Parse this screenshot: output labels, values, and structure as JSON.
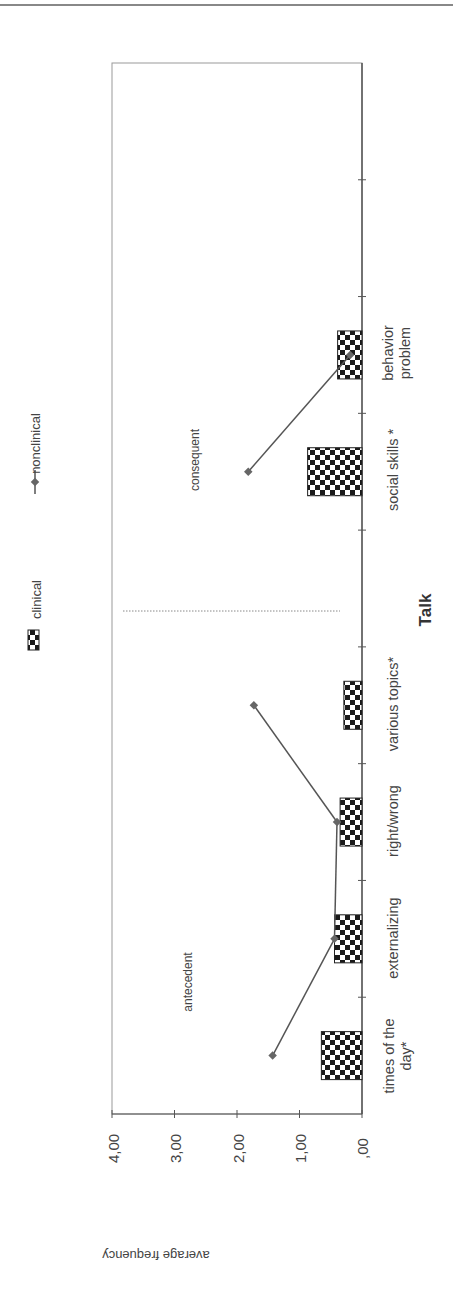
{
  "chart_data": {
    "type": "bar",
    "orientation": "rotated-90",
    "title": "",
    "xlabel": "Talk",
    "ylabel": "average frequency",
    "ylim": [
      0,
      4
    ],
    "yticks": [
      ",00",
      "1,00",
      "2,00",
      "3,00",
      "4,00"
    ],
    "grid": false,
    "legend_position": "top",
    "categories": [
      "times of the day*",
      "externalizing",
      "right/wrong",
      "various topics*",
      "",
      "social skills *",
      "behavior problem",
      "",
      ""
    ],
    "series": [
      {
        "name": "clinical",
        "kind": "bar",
        "pattern": "checkerboard",
        "values": [
          0.65,
          0.44,
          0.35,
          0.29,
          null,
          0.87,
          0.39,
          null,
          null
        ]
      },
      {
        "name": "nonclinical",
        "kind": "line",
        "marker": "diamond",
        "values": [
          1.43,
          0.44,
          0.4,
          1.73,
          null,
          1.82,
          0.19,
          null,
          null
        ]
      }
    ],
    "line_segments": [
      [
        0,
        1
      ],
      [
        1,
        2
      ],
      [
        2,
        3
      ],
      [
        5,
        6
      ]
    ],
    "annotations": [
      {
        "text": "antecedent",
        "group": "times of the day – various topics"
      },
      {
        "text": "consequent",
        "group": "social skills – behavior problem"
      }
    ],
    "separator": "dotted line between various topics and social skills"
  },
  "labels": {
    "x_title": "Talk",
    "y_title": "average frequency",
    "antecedent": "antecedent",
    "consequent": "consequent",
    "legend_clinical": "clinical",
    "legend_nonclinical": "nonclinical",
    "ticks": [
      "4,00",
      "3,00",
      "2,00",
      "1,00",
      ",00"
    ],
    "cat0_line1": "times of the",
    "cat0_line2": "day*",
    "cat1": "externalizing",
    "cat2": "right/wrong",
    "cat3": "various topics*",
    "cat5": "social skills *",
    "cat6_line1": "behavior",
    "cat6_line2": "problem"
  },
  "colors": {
    "axis": "#555555",
    "line": "#555555",
    "marker": "#666666",
    "bar_dark": "#1a1a1a",
    "bar_light": "#ffffff"
  }
}
